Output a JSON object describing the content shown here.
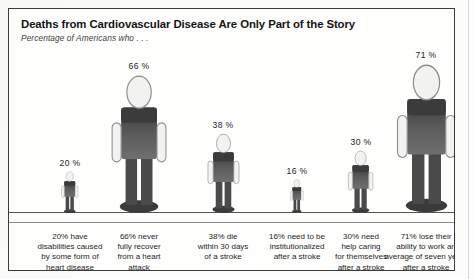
{
  "header": {
    "title": "Deaths from Cardiovascular Disease Are Only Part of the Story",
    "subtitle": "Percentage of Americans who . . ."
  },
  "chart_data": {
    "type": "bar",
    "title": "Deaths from Cardiovascular Disease Are Only Part of the Story",
    "subtitle": "Percentage of Americans who . . .",
    "xlabel": "",
    "ylabel": "Percentage of Americans",
    "ylim": [
      0,
      100
    ],
    "grid": false,
    "legend": null,
    "units": "%",
    "glyph": "human-pictogram",
    "categories": [
      "20% have disabilities caused by some form of heart disease",
      "66% never fully recover from a heart attack",
      "38% die within 30 days of a stroke",
      "16% need to be institutionalized after a stroke",
      "30% need help caring for themselves after a stroke",
      "71% lose their ability to work an average of seven years after a stroke"
    ],
    "values": [
      20,
      66,
      38,
      16,
      30,
      71
    ],
    "value_labels": [
      "20 %",
      "66 %",
      "38 %",
      "16 %",
      "30 %",
      "71 %"
    ]
  },
  "figures": [
    {
      "label": "20 %",
      "value": 20,
      "caption_lines": [
        "20% have",
        "disabilities caused",
        "by some form of",
        "heart disease"
      ]
    },
    {
      "label": "66 %",
      "value": 66,
      "caption_lines": [
        "66% never",
        "fully recover",
        "from a heart",
        "attack"
      ]
    },
    {
      "label": "38 %",
      "value": 38,
      "caption_lines": [
        "38% die",
        "within 30 days",
        "of a stroke"
      ]
    },
    {
      "label": "16 %",
      "value": 16,
      "caption_lines": [
        "16% need to be",
        "institutionalized",
        "after a stroke"
      ]
    },
    {
      "label": "30 %",
      "value": 30,
      "caption_lines": [
        "30% need",
        "help caring",
        "for themselves",
        "after a stroke"
      ]
    },
    {
      "label": "71 %",
      "value": 71,
      "caption_lines": [
        "71% lose their",
        "ability to work an",
        "average of seven years",
        "after a stroke"
      ]
    }
  ],
  "colors": {
    "frame": "#3a3a3a",
    "baseline": "#555555",
    "figure_dark": "#3b3b3b",
    "figure_mid": "#6f6f6f",
    "figure_light": "#f2f2f0",
    "text": "#1d1d1d",
    "page": "#fcfcfa"
  }
}
